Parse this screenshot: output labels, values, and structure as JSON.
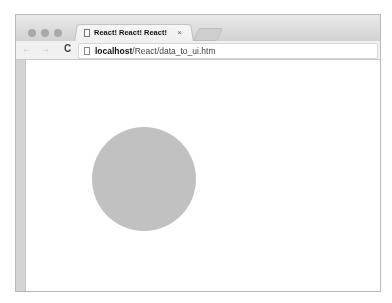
{
  "window": {
    "tab": {
      "title": "React! React! React!",
      "close_glyph": "×"
    },
    "toolbar": {
      "back_glyph": "←",
      "forward_glyph": "→",
      "reload_glyph": "C",
      "url_host": "localhost",
      "url_path": "/React/data_to_ui.htm"
    }
  },
  "content": {
    "circle": {
      "color": "#c1c1c1",
      "diameter": 104
    }
  },
  "colors": {
    "frame": "#d2d2d2",
    "background": "#ffffff"
  }
}
